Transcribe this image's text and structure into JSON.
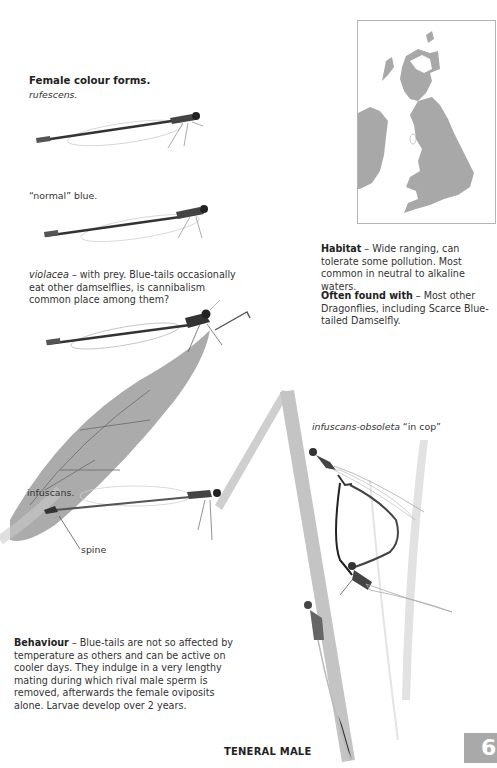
{
  "female_forms": {
    "heading": "Female colour forms.",
    "rufescens_caption": "rufescens.",
    "normal_caption": "“normal” blue.",
    "violacea_term": "violacea",
    "violacea_caption": " – with prey. Blue-tails occasionally eat other damselflies, is cannibalism common place among them?",
    "infuscans_caption": "infuscans.",
    "spine_label": "spine"
  },
  "map": {
    "description": "Distribution map of Britain and Ireland",
    "land_color": "#a8a8a8",
    "frame_color": "#b5b5b5"
  },
  "habitat": {
    "label": "Habitat",
    "text": " – Wide ranging, can tolerate some pollution. Most common in neutral to alkaline waters."
  },
  "often_found": {
    "label": "Often found with",
    "text": " – Most other Dragonflies, including Scarce Blue-tailed Damselfly."
  },
  "in_cop": {
    "term": "infuscans-obsoleta",
    "text": " “in cop”"
  },
  "behaviour": {
    "label": "Behaviour",
    "text": " – Blue-tails are not so affected by temperature as others and can be active on cooler days. They indulge in a very lengthy mating during which rival male sperm is removed, afterwards the female oviposits alone. Larvae develop over 2 years."
  },
  "teneral_label": "TENERAL MALE",
  "page_tab": {
    "number": "6",
    "color": "#a9a9a9"
  }
}
